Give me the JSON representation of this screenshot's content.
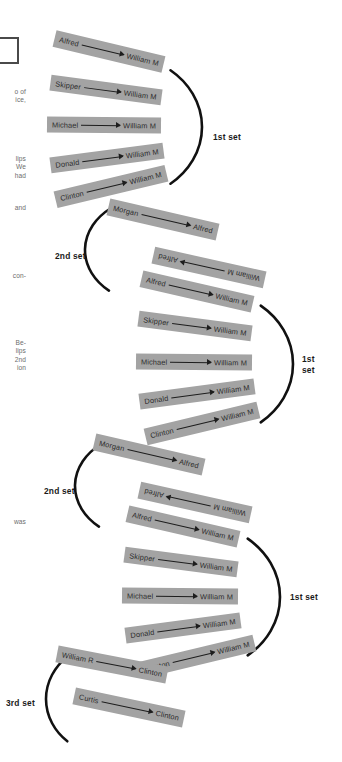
{
  "figure": {
    "slip_fill": "#a3a3a3",
    "slip_text_color": "#2b2b2b",
    "arc_color": "#111111",
    "margin_text_color": "#6d6d6d"
  },
  "margin_fragments": [
    {
      "text": "o of\nice,",
      "x": 0,
      "y": 88
    },
    {
      "text": "lips\nWe\nhad",
      "x": 0,
      "y": 155
    },
    {
      "text": "and",
      "x": 0,
      "y": 204
    },
    {
      "text": "con-",
      "x": 0,
      "y": 272
    },
    {
      "text": "Be-\nlips\n2nd\nion",
      "x": 0,
      "y": 339
    },
    {
      "text": "was",
      "x": 0,
      "y": 518
    }
  ],
  "groups": [
    {
      "name": "stage-1",
      "sets": [
        {
          "label": "1st set",
          "label_x": 213,
          "label_y": 132,
          "arc": {
            "cx": 120,
            "cy": 127,
            "rx": 82,
            "ry": 72,
            "start": -52,
            "end": 52
          },
          "slips": [
            {
              "from": "Alfred",
              "to": "William M",
              "x": 53,
              "y": 43,
              "w": 112,
              "h": 17,
              "rot": 13.5,
              "flipped": false
            },
            {
              "from": "Skipper",
              "to": "William M",
              "x": 50,
              "y": 82,
              "w": 112,
              "h": 16,
              "rot": 7.5,
              "flipped": false
            },
            {
              "from": "Michael",
              "to": "William M",
              "x": 47,
              "y": 117,
              "w": 114,
              "h": 16,
              "rot": 0.5,
              "flipped": false
            },
            {
              "from": "Donald",
              "to": "William M",
              "x": 50,
              "y": 150,
              "w": 114,
              "h": 16,
              "rot": -7.5,
              "flipped": false
            },
            {
              "from": "Clinton",
              "to": "William M",
              "x": 54,
              "y": 178,
              "w": 114,
              "h": 17,
              "rot": -13.5,
              "flipped": false
            }
          ]
        }
      ]
    },
    {
      "name": "stage-2",
      "sets": [
        {
          "label": "2nd set",
          "label_x": 55,
          "label_y": 251,
          "arc": {
            "cx": 152,
            "cy": 250,
            "rx": 67,
            "ry": 53,
            "start": 130,
            "end": 232
          },
          "slips": [
            {
              "from": "Morgan",
              "to": "Alfred",
              "x": 107,
              "y": 211,
              "w": 112,
              "h": 17,
              "rot": 13.0,
              "flipped": false
            },
            {
              "from": "William M",
              "to": "Alfred",
              "x": 152,
              "y": 259,
              "w": 114,
              "h": 17,
              "rot": 12.5,
              "flipped": true
            }
          ]
        },
        {
          "label": "1st\nset",
          "label_x": 302,
          "label_y": 354,
          "arc": {
            "cx": 209,
            "cy": 364,
            "rx": 84,
            "ry": 74,
            "start": -52,
            "end": 52
          },
          "slips": [
            {
              "from": "Alfred",
              "to": "William M",
              "x": 140,
              "y": 283,
              "w": 114,
              "h": 17,
              "rot": 13.0,
              "flipped": false
            },
            {
              "from": "Skipper",
              "to": "William M",
              "x": 138,
              "y": 318,
              "w": 114,
              "h": 16,
              "rot": 7.5,
              "flipped": false
            },
            {
              "from": "Michael",
              "to": "William M",
              "x": 136,
              "y": 354,
              "w": 116,
              "h": 16,
              "rot": 0.5,
              "flipped": false
            },
            {
              "from": "Donald",
              "to": "William M",
              "x": 139,
              "y": 386,
              "w": 116,
              "h": 16,
              "rot": -7.5,
              "flipped": false
            },
            {
              "from": "Clinton",
              "to": "William M",
              "x": 144,
              "y": 415,
              "w": 116,
              "h": 17,
              "rot": -13.5,
              "flipped": false
            }
          ]
        }
      ]
    },
    {
      "name": "stage-3",
      "sets": [
        {
          "label": "2nd set",
          "label_x": 44,
          "label_y": 486,
          "arc": {
            "cx": 142,
            "cy": 486,
            "rx": 67,
            "ry": 53,
            "start": 130,
            "end": 232
          },
          "slips": [
            {
              "from": "Morgan",
              "to": "Alfred",
              "x": 93,
              "y": 446,
              "w": 112,
              "h": 17,
              "rot": 13.0,
              "flipped": false
            },
            {
              "from": "William M",
              "to": "Alfred",
              "x": 138,
              "y": 494,
              "w": 114,
              "h": 17,
              "rot": 12.5,
              "flipped": true
            }
          ]
        },
        {
          "label": "1st set",
          "label_x": 290,
          "label_y": 592,
          "arc": {
            "cx": 196,
            "cy": 597,
            "rx": 84,
            "ry": 74,
            "start": -52,
            "end": 52
          },
          "slips": [
            {
              "from": "Alfred",
              "to": "William M",
              "x": 126,
              "y": 518,
              "w": 114,
              "h": 17,
              "rot": 13.0,
              "flipped": false
            },
            {
              "from": "Skipper",
              "to": "William M",
              "x": 124,
              "y": 554,
              "w": 114,
              "h": 16,
              "rot": 7.5,
              "flipped": false
            },
            {
              "from": "Michael",
              "to": "William M",
              "x": 122,
              "y": 588,
              "w": 116,
              "h": 16,
              "rot": 0.5,
              "flipped": false
            },
            {
              "from": "Donald",
              "to": "William M",
              "x": 125,
              "y": 620,
              "w": 116,
              "h": 16,
              "rot": -7.5,
              "flipped": false
            },
            {
              "from": "Clinton",
              "to": "William M",
              "x": 140,
              "y": 648,
              "w": 116,
              "h": 17,
              "rot": -13.5,
              "flipped": false
            }
          ]
        },
        {
          "label": "3rd set",
          "label_x": 6,
          "label_y": 698,
          "arc": {
            "cx": 108,
            "cy": 699,
            "rx": 62,
            "ry": 56,
            "start": 131,
            "end": 229
          },
          "slips": [
            {
              "from": "William R",
              "to": "Clinton",
              "x": 56,
              "y": 656,
              "w": 112,
              "h": 17,
              "rot": 11.0,
              "flipped": false
            },
            {
              "from": "Curtis",
              "to": "Clinton",
              "x": 73,
              "y": 699,
              "w": 112,
              "h": 17,
              "rot": 12.0,
              "flipped": false
            }
          ]
        }
      ]
    }
  ]
}
